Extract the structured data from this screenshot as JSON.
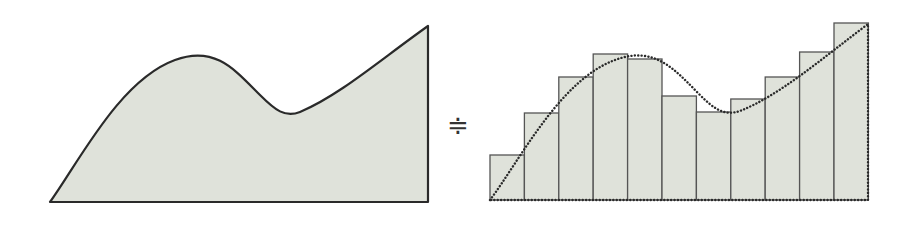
{
  "diagram": {
    "left_panel": {
      "label": "continuous-area",
      "fill": "#dfe2da",
      "stroke": "#2a2a2a",
      "path": "M50,202 C80,160 120,80 175,60 C215,45 235,70 260,95 C275,110 285,118 300,112 C340,95 380,60 428,26 L428,202 Z"
    },
    "relation_symbol": "≑",
    "right_panel": {
      "label": "rectangle-approximation",
      "fill": "#dfe2da",
      "bar_stroke": "#555555",
      "baseline_y": 200,
      "x_start": 490,
      "bar_width": 34.4,
      "bar_tops": [
        155,
        113,
        77,
        54,
        59,
        96,
        112,
        99,
        77,
        52,
        23
      ],
      "curve_path": "M490,200 C520,160 560,80 615,60 C655,45 675,70 700,95 C715,110 725,116 740,111 C780,95 820,60 868,24 L868,200 Z",
      "curve_style": "dotted"
    }
  }
}
